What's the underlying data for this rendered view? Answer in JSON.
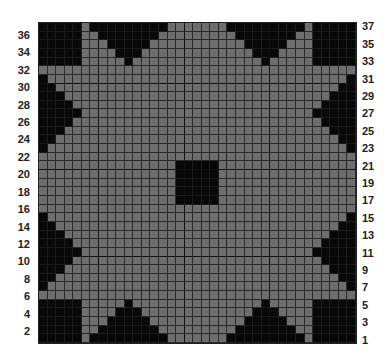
{
  "chart_data": {
    "type": "heatmap",
    "title": "",
    "columns": 37,
    "rows": 37,
    "row_labels_left": [
      36,
      34,
      32,
      30,
      28,
      26,
      24,
      22,
      20,
      18,
      16,
      14,
      12,
      10,
      8,
      6,
      4,
      2
    ],
    "row_labels_right": [
      37,
      35,
      33,
      31,
      29,
      27,
      25,
      23,
      21,
      19,
      17,
      15,
      13,
      11,
      9,
      7,
      5,
      3,
      1
    ],
    "colors": {
      "filled": "#080808",
      "empty": "#6e6e6e",
      "gridline": "#2a2a2a"
    },
    "thick_lines_after_col": [
      7,
      17,
      27
    ],
    "thick_lines_after_row_from_top": [
      7,
      17,
      27
    ],
    "filled_regions": [
      {
        "name": "corner-top-left",
        "rows": [
          33,
          37
        ],
        "cols": [
          1,
          5
        ]
      },
      {
        "name": "corner-top-right",
        "rows": [
          33,
          37
        ],
        "cols": [
          33,
          37
        ]
      },
      {
        "name": "corner-bottom-left",
        "rows": [
          1,
          5
        ],
        "cols": [
          1,
          5
        ]
      },
      {
        "name": "corner-bottom-right",
        "rows": [
          1,
          5
        ],
        "cols": [
          33,
          37
        ]
      },
      {
        "name": "center-square",
        "rows": [
          17,
          21
        ],
        "cols": [
          17,
          21
        ]
      },
      {
        "name": "triangle-top-left",
        "apex": {
          "row": 33,
          "col": 11
        },
        "base_row": 37,
        "base_cols": [
          7,
          15
        ]
      },
      {
        "name": "triangle-top-right",
        "apex": {
          "row": 33,
          "col": 27
        },
        "base_row": 37,
        "base_cols": [
          23,
          31
        ]
      },
      {
        "name": "triangle-bottom-left",
        "apex": {
          "row": 5,
          "col": 11
        },
        "base_row": 1,
        "base_cols": [
          7,
          15
        ]
      },
      {
        "name": "triangle-bottom-right",
        "apex": {
          "row": 5,
          "col": 27
        },
        "base_row": 1,
        "base_cols": [
          23,
          31
        ]
      },
      {
        "name": "triangle-left-upper",
        "apex": {
          "row": 27,
          "col": 5
        },
        "base_col": 1,
        "base_rows": [
          23,
          31
        ]
      },
      {
        "name": "triangle-left-lower",
        "apex": {
          "row": 11,
          "col": 5
        },
        "base_col": 1,
        "base_rows": [
          7,
          15
        ]
      },
      {
        "name": "triangle-right-upper",
        "apex": {
          "row": 27,
          "col": 33
        },
        "base_col": 37,
        "base_rows": [
          23,
          31
        ]
      },
      {
        "name": "triangle-right-lower",
        "apex": {
          "row": 11,
          "col": 33
        },
        "base_col": 37,
        "base_rows": [
          7,
          15
        ]
      }
    ]
  }
}
